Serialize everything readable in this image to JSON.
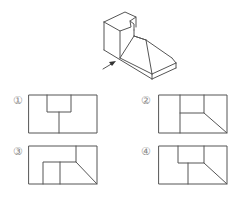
{
  "question": {
    "figure": "isometric-object-with-view-direction-arrow",
    "view_arrow": "arrow-indicating-front-view-direction",
    "options": [
      {
        "label": "①",
        "id": 1
      },
      {
        "label": "②",
        "id": 2
      },
      {
        "label": "③",
        "id": 3
      },
      {
        "label": "④",
        "id": 4
      }
    ]
  }
}
